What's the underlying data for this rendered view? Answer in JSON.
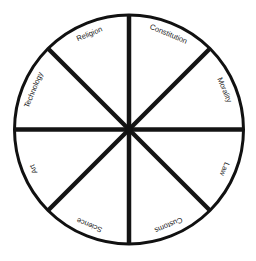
{
  "diagram": {
    "type": "wheel",
    "title": "",
    "center": [
      129,
      129
    ],
    "radius": 115,
    "spoke_count": 8,
    "colors": {
      "line": "#141414",
      "background": "#ffffff",
      "text": "#1a1a1a"
    },
    "segments": [
      {
        "label": "Religion",
        "position": "top-left"
      },
      {
        "label": "Constitution",
        "position": "top-right"
      },
      {
        "label": "Morality",
        "position": "right-upper"
      },
      {
        "label": "Law",
        "position": "right-lower"
      },
      {
        "label": "Customs",
        "position": "bottom-right"
      },
      {
        "label": "Science",
        "position": "bottom-left"
      },
      {
        "label": "Art",
        "position": "left-lower"
      },
      {
        "label": "Technology",
        "position": "left-upper"
      }
    ]
  }
}
